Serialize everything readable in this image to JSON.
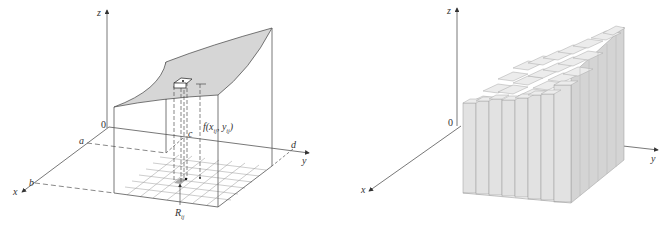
{
  "figures": [
    {
      "id": "left",
      "description": "Surface z = f(x,y) over rectangle R with sample column over subrectangle R_ij",
      "axes": {
        "x": "x",
        "y": "y",
        "z": "z",
        "origin": "0"
      },
      "labels": {
        "a": "a",
        "b": "b",
        "c": "c",
        "d": "d",
        "height": "f(x",
        "height_sub1": "ij",
        "height_sup1": "*",
        "height_mid": ", y",
        "height_sub2": "ij",
        "height_sup2": "*",
        "height_close": ")",
        "subrect": "R",
        "subrect_sub": "ij"
      },
      "grid": {
        "rows": 6,
        "cols": 8
      },
      "colors": {
        "surface": "#d6d6d6",
        "lines": "#555555",
        "grid": "#9a9a9a"
      }
    },
    {
      "id": "right",
      "description": "Riemann sum approximation by rectangular boxes (columns)",
      "axes": {
        "x": "x",
        "y": "y",
        "z": "z",
        "origin": "0"
      },
      "columns": {
        "front_count": 8,
        "depth_count": 6
      },
      "colors": {
        "box_face": "#e2e2e2",
        "box_side": "#cfcfcf",
        "box_top": "#ececec",
        "edge": "#9b9b9b"
      }
    }
  ]
}
